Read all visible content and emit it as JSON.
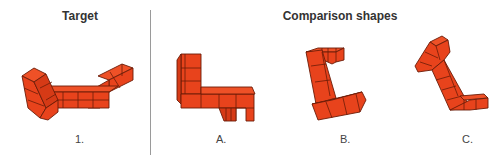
{
  "headers": {
    "target": "Target",
    "comparison": "Comparison shapes"
  },
  "labels": {
    "target": "1.",
    "a": "A.",
    "b": "B.",
    "c": "C."
  },
  "colors": {
    "cube_fill": "#E8431C",
    "cube_edge": "#6b1c08",
    "divider": "#9a9a9a",
    "text": "#333333"
  },
  "shapes": [
    {
      "id": "target-1",
      "description": "L-shaped 3D cube figure (target)"
    },
    {
      "id": "option-a",
      "description": "Comparison shape A"
    },
    {
      "id": "option-b",
      "description": "Comparison shape B"
    },
    {
      "id": "option-c",
      "description": "Comparison shape C"
    }
  ]
}
